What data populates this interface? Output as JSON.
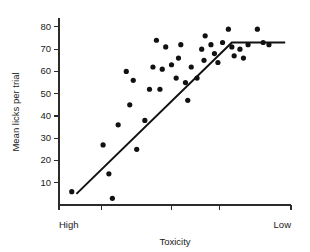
{
  "chart_data": {
    "type": "scatter",
    "title": "",
    "xlabel": "Toxicity",
    "ylabel": "Mean licks per trial",
    "xlim": [
      0,
      10
    ],
    "ylim": [
      0,
      84
    ],
    "grid": false,
    "legend": null,
    "x_axis": {
      "label": "Toxicity",
      "left_end_label": "High",
      "right_end_label": "Low",
      "tick_positions": [
        0,
        1.85,
        4.85,
        6.9,
        10
      ],
      "tick_labels": [
        "",
        "",
        "",
        "",
        ""
      ],
      "direction_note": "toxicity decreases left to right"
    },
    "y_axis": {
      "label": "Mean licks per trial",
      "ticks": [
        10,
        20,
        30,
        40,
        50,
        60,
        70,
        80
      ],
      "tick_labels": [
        "10",
        "20",
        "30",
        "40",
        "50",
        "60",
        "70",
        "80"
      ]
    },
    "points": [
      [
        0.55,
        6
      ],
      [
        2.15,
        14
      ],
      [
        2.3,
        3
      ],
      [
        1.9,
        27
      ],
      [
        2.55,
        36
      ],
      [
        3.05,
        45
      ],
      [
        3.7,
        38
      ],
      [
        3.35,
        25
      ],
      [
        3.2,
        56
      ],
      [
        3.9,
        52
      ],
      [
        4.35,
        52
      ],
      [
        4.05,
        62
      ],
      [
        4.45,
        61
      ],
      [
        4.2,
        74
      ],
      [
        4.85,
        63
      ],
      [
        4.6,
        71
      ],
      [
        5.05,
        57
      ],
      [
        5.25,
        72
      ],
      [
        5.15,
        66
      ],
      [
        5.45,
        55
      ],
      [
        5.55,
        47
      ],
      [
        5.7,
        62
      ],
      [
        5.95,
        57
      ],
      [
        6.15,
        70
      ],
      [
        6.3,
        76
      ],
      [
        6.25,
        65
      ],
      [
        6.55,
        72
      ],
      [
        6.7,
        68
      ],
      [
        6.85,
        64
      ],
      [
        7.05,
        73
      ],
      [
        7.3,
        79
      ],
      [
        7.45,
        71
      ],
      [
        7.55,
        67
      ],
      [
        7.8,
        70
      ],
      [
        7.95,
        66
      ],
      [
        8.15,
        72
      ],
      [
        8.55,
        79
      ],
      [
        8.8,
        73
      ],
      [
        9.05,
        72
      ],
      [
        2.9,
        60
      ]
    ],
    "fit_line": {
      "style": "two-segment piecewise linear (broken stick)",
      "vertices": [
        [
          0.75,
          5
        ],
        [
          7.45,
          73
        ],
        [
          9.75,
          73
        ]
      ]
    }
  }
}
